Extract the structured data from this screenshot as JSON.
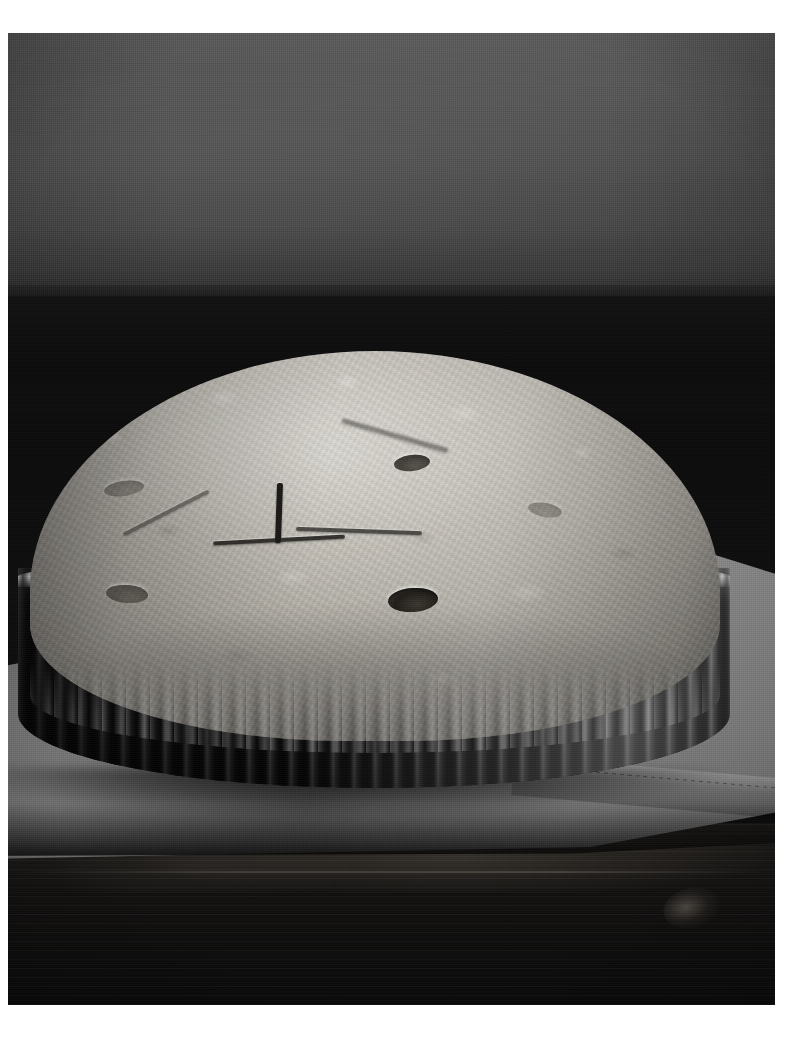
{
  "image": {
    "title": "Unbaked double-crust pie in a fluted tart pan",
    "medium": "black-and-white photograph",
    "orientation": "portrait",
    "canvas": {
      "width_px": 803,
      "height_px": 1039
    },
    "photo_area": {
      "left_px": 8,
      "top_px": 33,
      "width_px": 767,
      "height_px": 972
    },
    "mat_color": "#ffffff"
  },
  "scene": {
    "subject_label": "pie",
    "setting_label": "still life on a wooden table",
    "light_direction": "from the upper right",
    "depth_of_field": "shallow"
  },
  "elements": {
    "wall": {
      "label": "back wall",
      "color": "#4a4a4a",
      "color_top": "#565656",
      "color_bottom": "#2b2b2b",
      "texture": "fine vertical canvas weave"
    },
    "shadow_band": {
      "label": "deep shadow behind the table",
      "color": "#0a0a0a"
    },
    "table": {
      "label": "dark wooden tabletop",
      "color": "#0c0c0c",
      "grain": "horizontal",
      "highlight_color": "#6e6455"
    },
    "cloth": {
      "label": "gray linen cloth",
      "color": "#8d8d8d",
      "color_light": "#9a9a9a",
      "color_shadow": "#6e6e6e",
      "detail": "hemmed and stitched front-right edge with soft diagonal folds"
    },
    "pan": {
      "label": "fluted metal tart pan",
      "finish": "brushed steel",
      "color_dark": "#141414",
      "color_highlight": "#cfcfcf",
      "flute_count_visible": 34,
      "rim": "scalloped"
    },
    "crust": {
      "label": "pale unbaked top crust",
      "color_light": "#d9d6cf",
      "color_mid": "#b4b0a8",
      "color_shadow": "#807d77",
      "surface": "floury and mottled",
      "edge": "crimped pastry edge following the scalloped rim"
    },
    "vents": {
      "label": "steam vents",
      "slit_color": "#1a1815",
      "slits": [
        {
          "name": "center vertical slit"
        },
        {
          "name": "center horizontal slit"
        },
        {
          "name": "right horizontal slit"
        },
        {
          "name": "upper-left diagonal slit"
        },
        {
          "name": "upper-right diagonal slit"
        }
      ],
      "holes": [
        {
          "name": "center vent hole"
        },
        {
          "name": "upper-right vent hole"
        },
        {
          "name": "left vent hole"
        },
        {
          "name": "upper-left vent hole"
        },
        {
          "name": "far-right vent hole"
        }
      ]
    }
  },
  "palette": {
    "white_mat": "#ffffff",
    "wall_gray": "#4a4a4a",
    "cloth_gray": "#8d8d8d",
    "pastry_cream": "#c9c5bd",
    "pastry_highlight": "#d9d6cf",
    "metal_dark": "#141414",
    "wood_black": "#0c0c0c"
  }
}
